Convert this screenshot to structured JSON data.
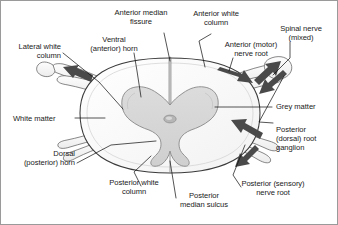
{
  "figure": {
    "background_color": "#ffffff",
    "border_color": "#9a9a9a",
    "ink_color": "#1a1a1a",
    "grey_matter_color": "#d6d6d6",
    "white_matter_color": "#fbfbfb",
    "arrow_color": "#4a4a4a",
    "outline_color": "#3a3a3a"
  },
  "labels": {
    "anterior_median_fissure": "Anterior median\nfissure",
    "anterior_white_column": "Anterior white\ncolumn",
    "spinal_nerve": "Spinal nerve\n(mixed)",
    "anterior_motor_nerve_root": "Anterior (motor)\nnerve root",
    "grey_matter": "Grey matter",
    "posterior_root_ganglion": "Posterior\n(dorsal) root\nganglion",
    "posterior_sensory_nerve_root": "Posterior (sensory)\nnerve root",
    "posterior_median_sulcus": "Posterior\nmedian sulcus",
    "posterior_white_column": "Posterior white\ncolumn",
    "dorsal_posterior_horn": "Dorsal\n(posterior) horn",
    "white_matter": "White matter",
    "lateral_white_column": "Lateral white\ncolumn",
    "ventral_anterior_horn": "Ventral\n(anterior) horn"
  },
  "structures": [
    "white matter",
    "grey matter",
    "ventral horn",
    "dorsal horn",
    "central canal",
    "anterior median fissure",
    "posterior median sulcus",
    "anterior motor nerve root",
    "posterior sensory nerve root",
    "posterior root ganglion",
    "spinal nerve"
  ]
}
